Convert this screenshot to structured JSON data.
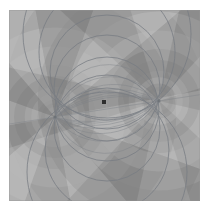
{
  "figure": {
    "title": "",
    "background_color": "#ffffff",
    "plot_background_color": "#9a9a9a",
    "plot_box": {
      "x": 9,
      "y": 10,
      "width": 191,
      "height": 191
    }
  },
  "chart_data": {
    "type": "heatmap",
    "title": "",
    "subtitle": "",
    "xlabel": "",
    "ylabel": "",
    "xlim": [
      -1,
      1
    ],
    "ylim": [
      -1,
      1
    ],
    "grid": false,
    "legend": "none",
    "colormap": "grayscale",
    "tick_labels_x": [],
    "tick_labels_y": [],
    "palette": {
      "darkest": "#6e6e6e",
      "dark": "#808080",
      "mid_dark": "#8e8e8e",
      "mid": "#9a9a9a",
      "mid_light": "#a8a8a8",
      "light": "#b6b6b6",
      "lightest": "#c6c6c6",
      "curve": "#7a7f85",
      "marker": "#2e2e2e"
    },
    "singularities": [
      {
        "name": "pole-left",
        "x": 55,
        "y": 117,
        "rays": 12
      },
      {
        "name": "pole-right",
        "x": 159,
        "y": 101,
        "rays": 12
      }
    ],
    "marker_point": {
      "name": "center-marker",
      "x": 104,
      "y": 102,
      "size": 4,
      "color": "#2e2e2e"
    },
    "coaxial_circles": [
      {
        "cx": 107,
        "cy": 34,
        "r": 84
      },
      {
        "cx": 107,
        "cy": 52,
        "r": 68
      },
      {
        "cx": 107,
        "cy": 72,
        "r": 57
      },
      {
        "cx": 107,
        "cy": 88,
        "r": 53
      },
      {
        "cx": 107,
        "cy": 128,
        "r": 53
      },
      {
        "cx": 107,
        "cy": 150,
        "r": 62
      },
      {
        "cx": 107,
        "cy": 172,
        "r": 80
      },
      {
        "cx": 107,
        "cy": 109,
        "r": 52
      }
    ],
    "orthogonal_arcs": 14,
    "wedge_count_per_pole": 12,
    "ring_count": 7
  }
}
